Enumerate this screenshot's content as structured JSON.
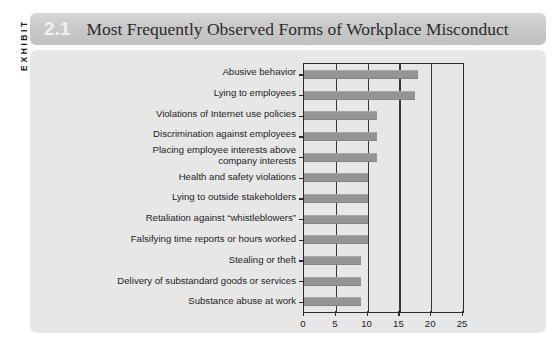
{
  "exhibit": {
    "side_label": "EXHIBIT",
    "number": "2.1",
    "title": "Most Frequently Observed Forms of Workplace Misconduct"
  },
  "chart_data": {
    "type": "bar",
    "orientation": "horizontal",
    "title": "Most Frequently Observed Forms of Workplace Misconduct",
    "xlabel": "",
    "ylabel": "",
    "xlim": [
      0,
      25
    ],
    "xticks": [
      0,
      5,
      10,
      15,
      20,
      25
    ],
    "xtick_labels": [
      "0",
      "5",
      "10",
      "15",
      "20",
      "25"
    ],
    "grid": true,
    "legend": false,
    "bar_color": "#949494",
    "categories": [
      "Abusive behavior",
      "Lying to employees",
      "Violations of Internet use policies",
      "Discrimination against employees",
      "Placing employee interests above company interests",
      "Health and safety violations",
      "Lying to outside stakeholders",
      "Retaliation against “whistleblowers”",
      "Falsifying time reports or hours worked",
      "Stealing or theft",
      "Delivery of substandard goods or services",
      "Substance abuse at work"
    ],
    "category_lines": [
      [
        "Abusive behavior"
      ],
      [
        "Lying to employees"
      ],
      [
        "Violations of Internet use policies"
      ],
      [
        "Discrimination against employees"
      ],
      [
        "Placing employee interests above",
        "company interests"
      ],
      [
        "Health and safety violations"
      ],
      [
        "Lying to outside stakeholders"
      ],
      [
        "Retaliation against “whistleblowers”"
      ],
      [
        "Falsifying time reports or hours worked"
      ],
      [
        "Stealing or theft"
      ],
      [
        "Delivery of substandard goods or services"
      ],
      [
        "Substance abuse at work"
      ]
    ],
    "values": [
      18,
      17.5,
      11.5,
      11.5,
      11.5,
      10,
      10,
      10,
      10,
      9,
      9,
      9
    ]
  },
  "colors": {
    "panel_bg": "#e7e7e7",
    "header_bg": "#c9c9c9",
    "bar": "#949494",
    "axis": "#2a2a2a",
    "text": "#1d1d1d",
    "number": "#f2f2f2"
  }
}
